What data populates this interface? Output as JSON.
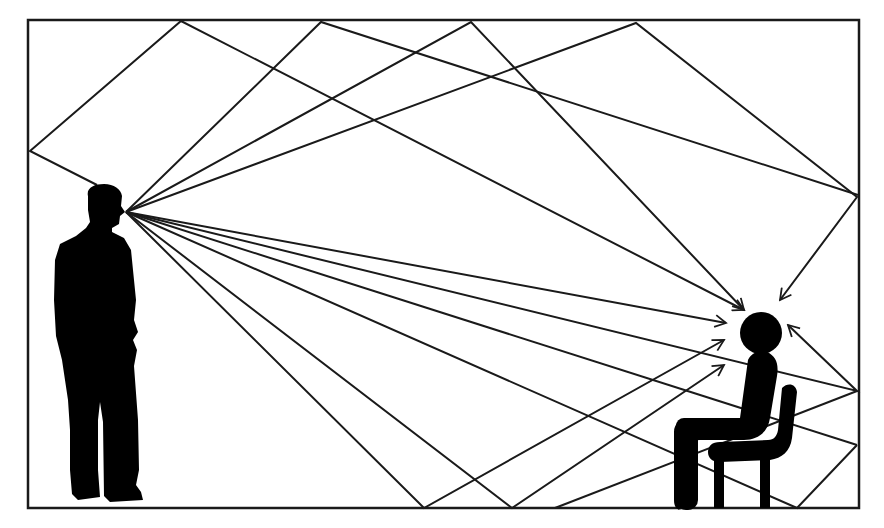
{
  "diagram": {
    "title": "Sound reflections in a room from speaker to listener",
    "room": {
      "x": 28,
      "y": 20,
      "width": 831,
      "height": 488,
      "stroke": "#1a1a1a",
      "stroke_width": 2.5
    },
    "colors": {
      "line": "#1a1a1a",
      "figure": "#000000",
      "background": "#ffffff"
    },
    "source": {
      "label": "Standing speaker",
      "mouth": [
        126,
        212
      ]
    },
    "listener": {
      "label": "Seated listener",
      "head": [
        761,
        333
      ],
      "head_radius": 21
    },
    "rays": [
      {
        "name": "direct-sound",
        "points": [
          [
            126,
            212
          ],
          [
            726,
            323
          ]
        ],
        "arrow": true
      },
      {
        "name": "left-wall-top-reflection",
        "points": [
          [
            97,
            185
          ],
          [
            30,
            151
          ],
          [
            181,
            21
          ],
          [
            744,
            310
          ]
        ],
        "arrow": true
      },
      {
        "name": "top-reflection-1",
        "points": [
          [
            126,
            212
          ],
          [
            321,
            22
          ],
          [
            858,
            195
          ]
        ],
        "arrow": false
      },
      {
        "name": "top-reflection-2",
        "points": [
          [
            126,
            212
          ],
          [
            471,
            22
          ],
          [
            744,
            310
          ]
        ],
        "arrow": true
      },
      {
        "name": "top-reflection-3",
        "points": [
          [
            126,
            212
          ],
          [
            636,
            23
          ],
          [
            857,
            197
          ],
          [
            780,
            300
          ]
        ],
        "arrow": true
      },
      {
        "name": "floor-reflection-1",
        "points": [
          [
            126,
            212
          ],
          [
            424,
            508
          ],
          [
            724,
            340
          ]
        ],
        "arrow": true
      },
      {
        "name": "floor-reflection-2",
        "points": [
          [
            126,
            212
          ],
          [
            512,
            508
          ],
          [
            724,
            365
          ]
        ],
        "arrow": true
      },
      {
        "name": "floor-reflection-3",
        "points": [
          [
            126,
            212
          ],
          [
            797,
            508
          ],
          [
            857,
            445
          ],
          [
            797,
            508
          ]
        ],
        "arrow": false
      },
      {
        "name": "right-wall-reflection-1",
        "points": [
          [
            126,
            212
          ],
          [
            857,
            391
          ],
          [
            788,
            325
          ]
        ],
        "arrow": true
      },
      {
        "name": "right-wall-reflection-2",
        "points": [
          [
            126,
            212
          ],
          [
            857,
            445
          ]
        ],
        "arrow": false
      },
      {
        "name": "floor-bounce-secondary",
        "points": [
          [
            555,
            508
          ],
          [
            857,
            391
          ]
        ],
        "arrow": false
      }
    ]
  }
}
